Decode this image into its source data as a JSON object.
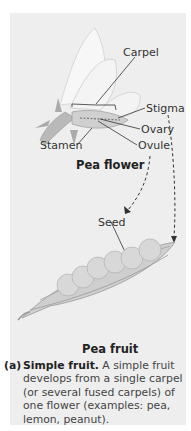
{
  "figure": {
    "flower_title": "Pea flower",
    "fruit_title": "Pea fruit",
    "labels": {
      "carpel": "Carpel",
      "stigma": "Stigma",
      "ovary": "Ovary",
      "stamen": "Stamen",
      "ovule": "Ovule",
      "seed": "Seed"
    },
    "caption": {
      "tag": "(a)",
      "heading": "Simple fruit.",
      "body": " A simple fruit develops from a single carpel (or several fused carpels) of one flower (examples: pea, lemon, peanut)."
    },
    "colors": {
      "panel": "#eeeeee",
      "line": "#333333",
      "pod": "#c8c8c8",
      "pea": "#d6d6d6"
    }
  }
}
